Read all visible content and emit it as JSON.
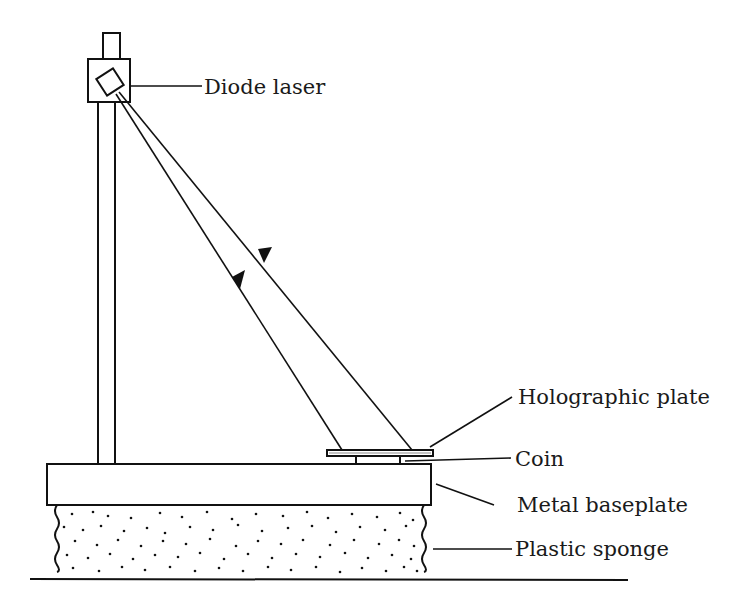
{
  "diagram": {
    "type": "apparatus-schematic",
    "labels": {
      "diode_laser": "Diode laser",
      "holographic_plate": "Holographic plate",
      "coin": "Coin",
      "metal_baseplate": "Metal baseplate",
      "plastic_sponge": "Plastic sponge"
    },
    "components": [
      {
        "id": "diode_laser",
        "label": "Diode laser"
      },
      {
        "id": "vertical_post",
        "label": ""
      },
      {
        "id": "laser_beams",
        "label": "",
        "count": 2
      },
      {
        "id": "holographic_plate",
        "label": "Holographic plate"
      },
      {
        "id": "coin",
        "label": "Coin"
      },
      {
        "id": "metal_baseplate",
        "label": "Metal baseplate"
      },
      {
        "id": "plastic_sponge",
        "label": "Plastic sponge"
      }
    ]
  }
}
